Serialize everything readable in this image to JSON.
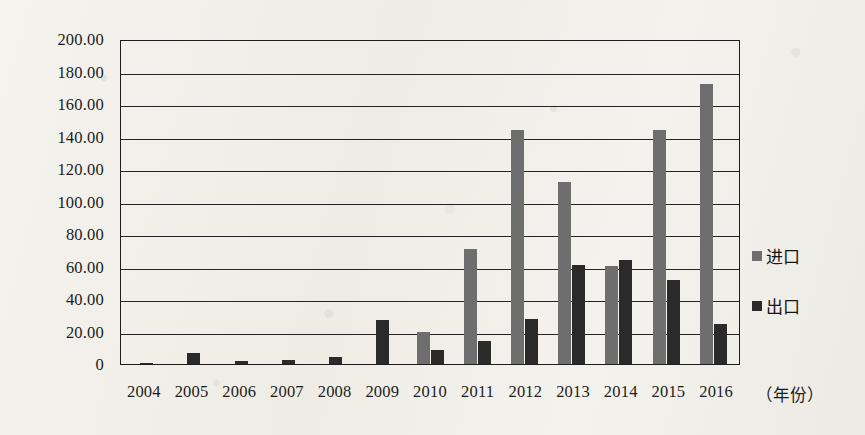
{
  "chart_data": {
    "type": "bar",
    "title": "",
    "xlabel": "（年份）",
    "ylabel": "",
    "ylim": [
      0,
      200
    ],
    "ytick_labels": [
      "200.00",
      "180.00",
      "160.00",
      "140.00",
      "120.00",
      "100.00",
      "80.00",
      "60.00",
      "40.00",
      "20.00",
      "0"
    ],
    "ytick_values": [
      200,
      180,
      160,
      140,
      120,
      100,
      80,
      60,
      40,
      20,
      0
    ],
    "grid": true,
    "legend_position": "right",
    "categories": [
      "2004",
      "2005",
      "2006",
      "2007",
      "2008",
      "2009",
      "2010",
      "2011",
      "2012",
      "2013",
      "2014",
      "2015",
      "2016"
    ],
    "series": [
      {
        "name": "进口",
        "color": "#6e6e6e",
        "values": [
          0,
          0,
          0,
          0,
          0,
          0,
          20.0,
          70.5,
          144.0,
          112.0,
          60.5,
          144.0,
          172.5
        ]
      },
      {
        "name": "出口",
        "color": "#2a2a2a",
        "values": [
          0.3,
          6.5,
          1.8,
          2.3,
          4.5,
          27.0,
          8.5,
          14.0,
          27.5,
          61.0,
          64.0,
          51.5,
          24.5
        ]
      }
    ]
  },
  "legend": {
    "items": [
      {
        "label": "进口",
        "swatch": "import"
      },
      {
        "label": "出口",
        "swatch": "export"
      }
    ]
  },
  "axis": {
    "x_title": "（年份）"
  }
}
